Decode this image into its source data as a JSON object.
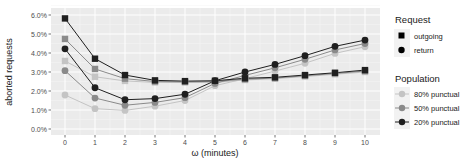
{
  "chart_data": {
    "type": "line",
    "title": "",
    "xlabel": "ω (minutes)",
    "ylabel": "aborted requests",
    "x": [
      0,
      1,
      2,
      3,
      4,
      5,
      6,
      7,
      8,
      9,
      10
    ],
    "xlim": [
      0,
      10
    ],
    "ylim": [
      0,
      6
    ],
    "y_ticks": [
      "0.0%",
      "1.0%",
      "2.0%",
      "3.0%",
      "4.0%",
      "5.0%",
      "6.0%"
    ],
    "x_ticks": [
      "0",
      "1",
      "2",
      "3",
      "4",
      "5",
      "6",
      "7",
      "8",
      "9",
      "10"
    ],
    "grid": true,
    "legend_position": "right",
    "series": [
      {
        "name": "outgoing, 20% punctual",
        "request": "outgoing",
        "population": "20% punctual",
        "marker": "square",
        "color": "#1f1f1f",
        "values": [
          5.82,
          3.7,
          2.84,
          2.56,
          2.52,
          2.54,
          2.67,
          2.72,
          2.84,
          2.96,
          3.1
        ]
      },
      {
        "name": "outgoing, 50% punctual",
        "request": "outgoing",
        "population": "50% punctual",
        "marker": "square",
        "color": "#8a8a8a",
        "values": [
          4.74,
          3.16,
          2.65,
          2.5,
          2.48,
          2.5,
          2.62,
          2.68,
          2.8,
          2.92,
          3.05
        ]
      },
      {
        "name": "outgoing, 80% punctual",
        "request": "outgoing",
        "population": "80% punctual",
        "marker": "square",
        "color": "#c4c4c4",
        "values": [
          3.58,
          2.75,
          2.53,
          2.45,
          2.45,
          2.45,
          2.58,
          2.65,
          2.76,
          2.88,
          3.0
        ]
      },
      {
        "name": "return, 20% punctual",
        "request": "return",
        "population": "20% punctual",
        "marker": "circle",
        "color": "#1f1f1f",
        "values": [
          4.22,
          2.17,
          1.54,
          1.6,
          1.83,
          2.54,
          3.0,
          3.4,
          3.86,
          4.35,
          4.68
        ]
      },
      {
        "name": "return, 50% punctual",
        "request": "return",
        "population": "50% punctual",
        "marker": "circle",
        "color": "#8a8a8a",
        "values": [
          3.07,
          1.63,
          1.25,
          1.4,
          1.65,
          2.4,
          2.82,
          3.22,
          3.67,
          4.16,
          4.5
        ]
      },
      {
        "name": "return, 80% punctual",
        "request": "return",
        "population": "80% punctual",
        "marker": "circle",
        "color": "#c4c4c4",
        "values": [
          1.79,
          1.07,
          0.98,
          1.2,
          1.5,
          2.28,
          2.65,
          3.05,
          3.46,
          3.98,
          4.33
        ]
      }
    ],
    "legend": {
      "request": {
        "title": "Request",
        "items": [
          {
            "label": "outgoing",
            "marker": "square"
          },
          {
            "label": "return",
            "marker": "circle"
          }
        ]
      },
      "population": {
        "title": "Population",
        "items": [
          {
            "label": "80% punctual",
            "color": "#c4c4c4"
          },
          {
            "label": "50% punctual",
            "color": "#8a8a8a"
          },
          {
            "label": "20% punctual",
            "color": "#1f1f1f"
          }
        ]
      }
    }
  },
  "style": {
    "panel_bg": "#ebebeb",
    "grid_major": "#ffffff",
    "grid_minor": "#f4f4f4"
  }
}
